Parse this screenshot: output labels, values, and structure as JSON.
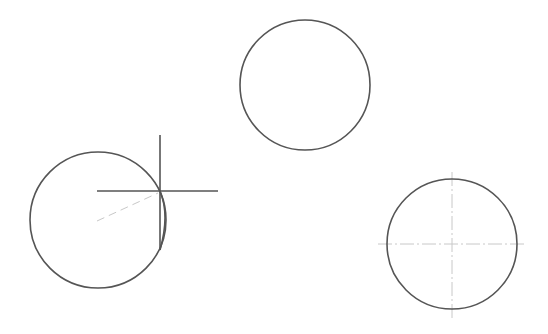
{
  "canvas": {
    "background": "#ffffff",
    "stroke_color": "#555555",
    "centerline_color": "#c8c8c8"
  },
  "circles": [
    {
      "name": "circle-left",
      "cx": 98,
      "cy": 220,
      "r": 68
    },
    {
      "name": "circle-top",
      "cx": 305,
      "cy": 85,
      "r": 65
    },
    {
      "name": "circle-right",
      "cx": 452,
      "cy": 244,
      "r": 65
    }
  ],
  "crosshair": {
    "x": 160,
    "y": 191,
    "v_top": 135,
    "v_bottom": 250,
    "h_left": 97,
    "h_right": 218
  },
  "rubberband": {
    "x1": 97,
    "y1": 221,
    "x2": 158,
    "y2": 193
  },
  "centerlines": {
    "h_left": 378,
    "h_right": 527,
    "v_top": 172,
    "v_bottom": 318
  }
}
